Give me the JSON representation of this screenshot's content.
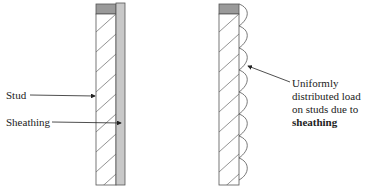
{
  "diagram": {
    "left_panel": {
      "labels": {
        "stud": "Stud",
        "sheathing": "Sheathing"
      }
    },
    "right_panel": {
      "annotation": {
        "line1": "Uniformly",
        "line2": "distributed load",
        "line3": "on studs due to",
        "line4": "sheathing"
      },
      "load_bumps": 8
    },
    "colors": {
      "stroke": "#555555",
      "stud_cap": "#9a9a9a",
      "sheathing_fill": "#c8c8c8",
      "text": "#222222"
    }
  }
}
